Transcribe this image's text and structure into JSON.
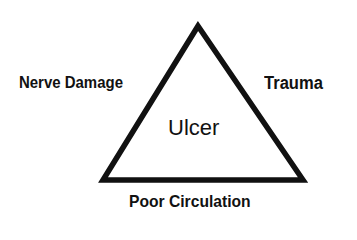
{
  "diagram": {
    "type": "triangle",
    "center_label": "Ulcer",
    "labels": {
      "left": "Nerve Damage",
      "right": "Trauma",
      "bottom": "Poor Circulation"
    },
    "colors": {
      "stroke": "#111111",
      "background": "#ffffff"
    }
  }
}
